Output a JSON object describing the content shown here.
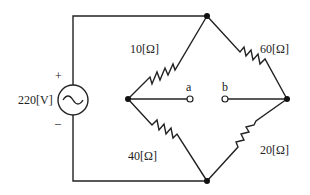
{
  "source": {
    "label": "220[V]",
    "plus": "+",
    "minus": "–"
  },
  "resistors": {
    "r1": "10[Ω]",
    "r2": "60[Ω]",
    "r3": "40[Ω]",
    "r4": "20[Ω]"
  },
  "terminals": {
    "a": "a",
    "b": "b"
  }
}
